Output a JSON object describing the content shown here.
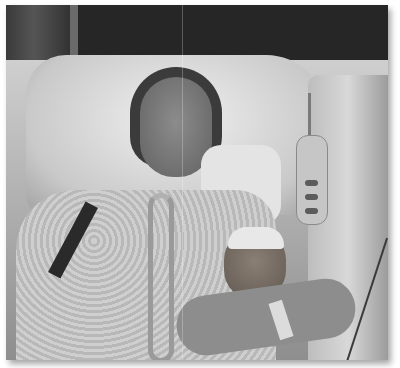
{
  "image": {
    "kind": "photograph",
    "tone": "grayscale",
    "description": "Patient lying in a hospital bed on a pillow with a breathing tube, holding a teddy bear wearing a white hat; a bed remote hangs on the side rail, with medical wires and a wristband visible",
    "colors": {
      "background": "#ffffff",
      "wall": "#262626",
      "sheets": "#cfcfcf",
      "shadow": "rgba(0,0,0,0.35)"
    }
  }
}
